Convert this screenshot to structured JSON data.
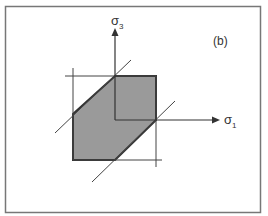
{
  "figure": {
    "panel_label": "(b)",
    "axes": {
      "horizontal": {
        "symbol": "σ",
        "subscript": "1"
      },
      "vertical": {
        "symbol": "σ",
        "subscript": "3"
      }
    },
    "colors": {
      "frame": "#777777",
      "line": "#333333",
      "fill": "#9a9a9a",
      "background": "#ffffff"
    }
  }
}
